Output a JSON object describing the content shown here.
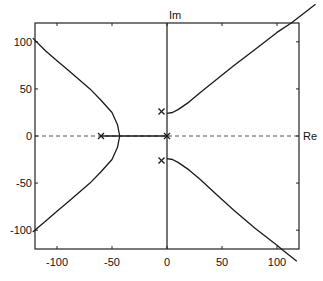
{
  "chart_data": {
    "type": "line",
    "title": "",
    "subtitle": "Root locus",
    "xlabel": "Re",
    "ylabel": "Im",
    "xlim": [
      -120,
      120
    ],
    "ylim": [
      -120,
      120
    ],
    "grid": false,
    "legend": null,
    "xticks": [
      -100,
      -50,
      0,
      50,
      100
    ],
    "yticks": [
      -100,
      -50,
      0,
      50,
      100
    ],
    "xtick_labels": [
      "-100",
      "-50",
      "0",
      "50",
      "100"
    ],
    "ytick_labels": [
      "-100",
      "-50",
      "0",
      "50",
      "100"
    ],
    "poles": [
      {
        "re": -60,
        "im": 0
      },
      {
        "re": 0,
        "im": 0
      },
      {
        "re": -5,
        "im": 26
      },
      {
        "re": -5,
        "im": -26
      }
    ],
    "series": [
      {
        "name": "branch-left-upper",
        "x": [
          -43,
          -45,
          -50,
          -60,
          -70,
          -80,
          -90,
          -100,
          -110,
          -122
        ],
        "y": [
          0,
          12,
          25,
          38,
          50,
          60,
          70,
          80,
          90,
          104
        ]
      },
      {
        "name": "branch-left-lower",
        "x": [
          -43,
          -45,
          -50,
          -60,
          -70,
          -80,
          -90,
          -100,
          -110,
          -122
        ],
        "y": [
          0,
          -12,
          -25,
          -38,
          -50,
          -60,
          -70,
          -80,
          -90,
          -102
        ]
      },
      {
        "name": "branch-real-axis",
        "x": [
          -60,
          0
        ],
        "y": [
          0,
          0
        ]
      },
      {
        "name": "branch-right-upper",
        "x": [
          0,
          5,
          10,
          20,
          30,
          45,
          60,
          80,
          100,
          113,
          135
        ],
        "y": [
          24,
          25,
          28,
          36,
          46,
          60,
          74,
          92,
          110,
          120,
          140
        ]
      },
      {
        "name": "branch-right-lower",
        "x": [
          0,
          5,
          10,
          20,
          30,
          45,
          60,
          80,
          100,
          104,
          118
        ],
        "y": [
          -24,
          -25,
          -28,
          -36,
          -46,
          -62,
          -78,
          -98,
          -116,
          -120,
          -133
        ]
      }
    ],
    "annotations": [
      "x markers denote open-loop poles",
      "dashed line marks real axis"
    ]
  },
  "plot": {
    "x_axis_label": "Re",
    "y_axis_label": "Im",
    "x_ticks": [
      {
        "value": -100,
        "label": "-100"
      },
      {
        "value": -50,
        "label": "-50"
      },
      {
        "value": 0,
        "label": "0"
      },
      {
        "value": 50,
        "label": "50"
      },
      {
        "value": 100,
        "label": "100"
      }
    ],
    "y_ticks": [
      {
        "value": 100,
        "label": "100"
      },
      {
        "value": 50,
        "label": "50"
      },
      {
        "value": 0,
        "label": "0"
      },
      {
        "value": -50,
        "label": "-50"
      },
      {
        "value": -100,
        "label": "-100"
      }
    ],
    "colors": {
      "line": "#1a1a1a",
      "axis": "#222222",
      "dash": "#555555"
    }
  }
}
